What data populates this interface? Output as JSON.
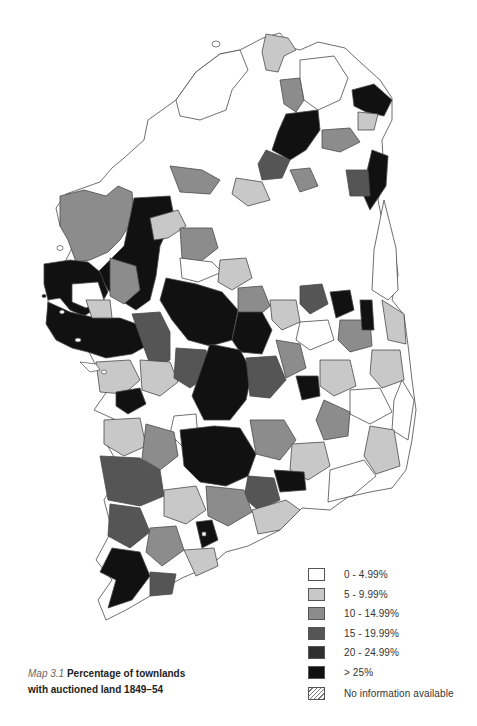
{
  "map": {
    "title": "Percentage of townlands with auctioned land 1849–54",
    "region": "Ireland",
    "unit": "townland-based districts",
    "colors": {
      "c0": "#ffffff",
      "c1": "#c8c8c8",
      "c2": "#8c8c8c",
      "c3": "#555555",
      "c4": "#2f2f2f",
      "c5": "#111111",
      "border": "#4a4a4a"
    }
  },
  "legend": {
    "items": [
      {
        "label": "0 - 4.99%",
        "color": "#ffffff",
        "pattern": "solid"
      },
      {
        "label": "5 - 9.99%",
        "color": "#c8c8c8",
        "pattern": "stipple"
      },
      {
        "label": "10 - 14.99%",
        "color": "#8c8c8c",
        "pattern": "stipple"
      },
      {
        "label": "15 - 19.99%",
        "color": "#555555",
        "pattern": "stipple"
      },
      {
        "label": "20 - 24.99%",
        "color": "#2f2f2f",
        "pattern": "solid"
      },
      {
        "label": "> 25%",
        "color": "#111111",
        "pattern": "solid"
      },
      {
        "label": "No information available",
        "color": "#ffffff",
        "pattern": "hatch"
      }
    ]
  },
  "caption": {
    "number": "Map 3.1",
    "line1": "Percentage of townlands",
    "line2": "with auctioned land 1849–54"
  }
}
